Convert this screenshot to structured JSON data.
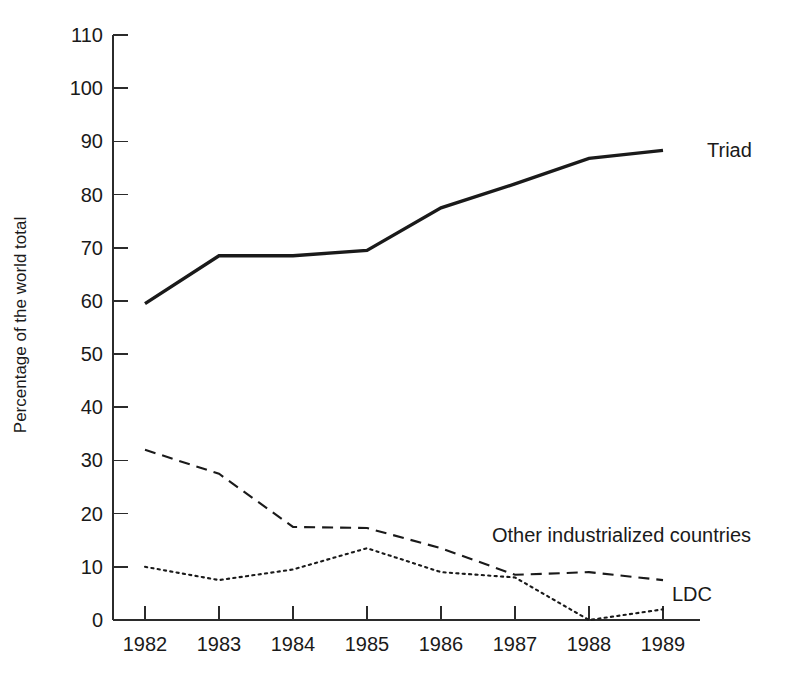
{
  "chart_data": {
    "type": "line",
    "title": "",
    "xlabel": "",
    "ylabel": "Percentage of the world total",
    "categories": [
      "1982",
      "1983",
      "1984",
      "1985",
      "1986",
      "1987",
      "1988",
      "1989"
    ],
    "x": [
      1982,
      1983,
      1984,
      1985,
      1986,
      1987,
      1988,
      1989
    ],
    "ylim": [
      0,
      110
    ],
    "yticks": [
      0,
      10,
      20,
      30,
      40,
      50,
      60,
      70,
      80,
      90,
      100,
      110
    ],
    "ytick_labels": [
      "0",
      "10",
      "20",
      "30",
      "40",
      "50",
      "60",
      "70",
      "80",
      "90",
      "100",
      "110"
    ],
    "grid": false,
    "legend_position": "inline-right-of-line-end",
    "series": [
      {
        "name": "Triad",
        "style": "solid",
        "color": "#1a1a1a",
        "label_x": 1989,
        "label_y": 88.3,
        "values": [
          59.5,
          68.5,
          68.5,
          69.5,
          77.5,
          82.0,
          86.8,
          88.3
        ]
      },
      {
        "name": "Other industrialized countries",
        "style": "dashed",
        "color": "#1a1a1a",
        "label_x": 1987,
        "label_y": 13.5,
        "values": [
          32.0,
          27.5,
          17.5,
          17.3,
          13.5,
          8.5,
          9.0,
          7.5
        ]
      },
      {
        "name": "LDC",
        "style": "dotted",
        "color": "#1a1a1a",
        "label_x": 1989,
        "label_y": 4.0,
        "values": [
          10.0,
          7.5,
          9.5,
          13.5,
          9.0,
          8.0,
          0.0,
          2.0
        ]
      }
    ],
    "annotations": [
      {
        "text": "Triad",
        "x": 1989,
        "y": 88.3
      },
      {
        "text": "Other industrialized countries",
        "x": 1987,
        "y": 13.5
      },
      {
        "text": "LDC",
        "x": 1989,
        "y": 4.0
      }
    ]
  },
  "labels": {
    "ylabel": "Percentage of the world total",
    "triad": "Triad",
    "other": "Other industrialized countries",
    "ldc": "LDC"
  }
}
